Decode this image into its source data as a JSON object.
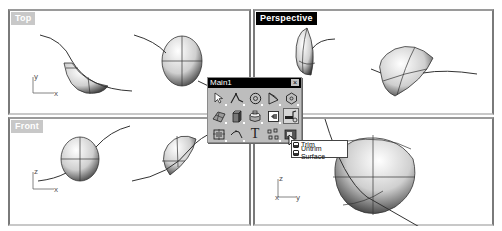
{
  "viewports": {
    "top": {
      "label": "Top",
      "active": false,
      "axes": [
        "y",
        "x"
      ]
    },
    "perspective": {
      "label": "Perspective",
      "active": true,
      "axes": [
        "z"
      ]
    },
    "front": {
      "label": "Front",
      "active": false,
      "axes": [
        "z",
        "x"
      ]
    },
    "right": {
      "label": "",
      "active": false,
      "axes": [
        "z",
        "x",
        "y"
      ]
    }
  },
  "toolbar": {
    "title": "Main1",
    "close_label": "×",
    "buttons": [
      {
        "icon": "select-arrow-icon"
      },
      {
        "icon": "polyline-icon"
      },
      {
        "icon": "circle-icon"
      },
      {
        "icon": "curve-icon"
      },
      {
        "icon": "polygon-icon"
      },
      {
        "icon": "surface-patch-icon"
      },
      {
        "icon": "box-solid-icon"
      },
      {
        "icon": "cylinder-icon"
      },
      {
        "icon": "mesh-icon"
      },
      {
        "icon": "trim-icon",
        "pressed": true
      },
      {
        "icon": "grid-snap-icon"
      },
      {
        "icon": "fillet-curve-icon"
      },
      {
        "icon": "text-icon"
      },
      {
        "icon": "points-icon"
      },
      {
        "icon": "render-icon"
      }
    ],
    "text_glyph": "T"
  },
  "flyout": {
    "items": [
      {
        "label": "Trim"
      },
      {
        "label": "Untrim Surface"
      }
    ]
  }
}
